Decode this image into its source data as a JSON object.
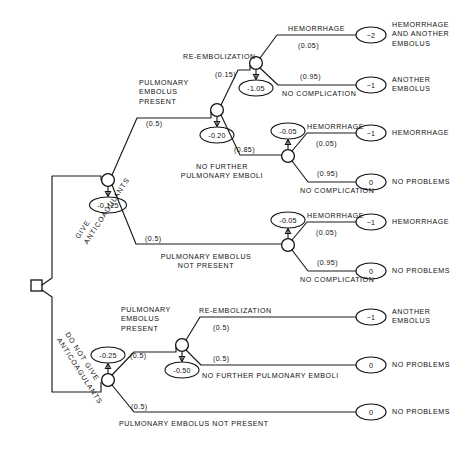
{
  "diagram": {
    "type": "decision-tree",
    "root": {
      "name": "root-decision-node",
      "shape": "square",
      "x": 36,
      "y": 285
    },
    "branch_labels": {
      "give": "GIVE\nANTICOAGULANTS",
      "give_line1": "GIVE",
      "give_line2": "ANTICOAGULANTS",
      "do_not_give_line1": "DO NOT GIVE",
      "do_not_give_line2": "ANTICOAGULANTS"
    },
    "nodes": [
      {
        "id": "n-give",
        "label": "chance-node-give-anticoagulants",
        "x": 108,
        "y": 180,
        "ev": "-0.125"
      },
      {
        "id": "n-pe-present",
        "label": "chance-node-pulmonary-embolus-present",
        "x": 217,
        "y": 110,
        "ev": "-0.20"
      },
      {
        "id": "n-reembolization",
        "label": "chance-node-re-embolization",
        "x": 256,
        "y": 63,
        "ev": "-1.05"
      },
      {
        "id": "n-no-further",
        "label": "chance-node-no-further-pulmonary-emboli",
        "x": 288,
        "y": 156,
        "ev": "-0.05"
      },
      {
        "id": "n-pe-not-present",
        "label": "chance-node-pulmonary-embolus-not-present",
        "x": 288,
        "y": 245,
        "ev": "-0.05"
      },
      {
        "id": "n-donotgive",
        "label": "chance-node-do-not-give-anticoagulants",
        "x": 108,
        "y": 380,
        "ev": "-0.25"
      },
      {
        "id": "n-pe-present-2",
        "label": "chance-node-pulmonary-embolus-present-lower",
        "x": 182,
        "y": 345,
        "ev": "-0.50"
      }
    ],
    "probabilities": {
      "give_pe_present": "(0.5)",
      "give_pe_not_present": "(0.5)",
      "reembolization": "(0.15)",
      "no_further_emboli": "(0.85)",
      "hemorrhage_top": "(0.05)",
      "no_complication_top": "(0.95)",
      "hemorrhage_mid": "(0.05)",
      "no_complication_mid": "(0.95)",
      "hemorrhage_low": "(0.05)",
      "no_complication_low": "(0.95)",
      "dng_pe_present": "(0.5)",
      "dng_pe_not_present": "(0.5)",
      "dng_reembolization": "(0.5)",
      "dng_no_further": "(0.5)"
    },
    "edge_labels": {
      "pulmonary_embolus_present_l1": "PULMONARY",
      "pulmonary_embolus_present_l2": "EMBOLUS",
      "pulmonary_embolus_present_l3": "PRESENT",
      "re_embolization": "RE-EMBOLIZATION",
      "no_further_l1": "NO FURTHER",
      "no_further_l2": "PULMONARY EMBOLI",
      "hemorrhage": "HEMORRHAGE",
      "no_complication": "NO COMPLICATION",
      "pulmonary_embolus_not_present_l1": "PULMONARY EMBOLUS",
      "pulmonary_embolus_not_present_l2": "NOT PRESENT",
      "no_further_inline": "NO FURTHER PULMONARY EMBOLI",
      "pulmonary_embolus_not_present_inline": "PULMONARY EMBOLUS NOT PRESENT"
    },
    "terminals": [
      {
        "id": "t1",
        "value": "−2",
        "x": 371,
        "y": 35,
        "outcome_lines": [
          "HEMORRHAGE",
          "AND ANOTHER",
          "EMBOLUS"
        ]
      },
      {
        "id": "t2",
        "value": "−1",
        "x": 371,
        "y": 85,
        "outcome_lines": [
          "ANOTHER",
          "EMBOLUS"
        ]
      },
      {
        "id": "t3",
        "value": "−1",
        "x": 371,
        "y": 133,
        "outcome_lines": [
          "HEMORRHAGE"
        ]
      },
      {
        "id": "t4",
        "value": "0",
        "x": 371,
        "y": 182,
        "outcome_lines": [
          "NO PROBLEMS"
        ]
      },
      {
        "id": "t5",
        "value": "−1",
        "x": 371,
        "y": 222,
        "outcome_lines": [
          "HEMORRHAGE"
        ]
      },
      {
        "id": "t6",
        "value": "0",
        "x": 371,
        "y": 271,
        "outcome_lines": [
          "NO PROBLEMS"
        ]
      },
      {
        "id": "t7",
        "value": "0",
        "x": 371,
        "y": 271,
        "outcome_lines": [
          "NO PROBLEMS"
        ]
      },
      {
        "id": "t8",
        "value": "−1",
        "x": 371,
        "y": 317,
        "outcome_lines": [
          "ANOTHER",
          "EMBOLUS"
        ]
      },
      {
        "id": "t9",
        "value": "0",
        "x": 371,
        "y": 365,
        "outcome_lines": [
          "NO PROBLEMS"
        ]
      },
      {
        "id": "t10",
        "value": "0",
        "x": 371,
        "y": 415,
        "outcome_lines": [
          "NO PROBLEMS"
        ]
      }
    ],
    "expected_values": {
      "root_give": "-0.125",
      "pe_present_give": "-0.20",
      "re_embolization": "-1.05",
      "no_further_emboli": "-0.05",
      "pe_not_present_give": "-0.05",
      "root_do_not_give": "-0.25",
      "pe_present_do_not_give": "-0.50"
    }
  }
}
